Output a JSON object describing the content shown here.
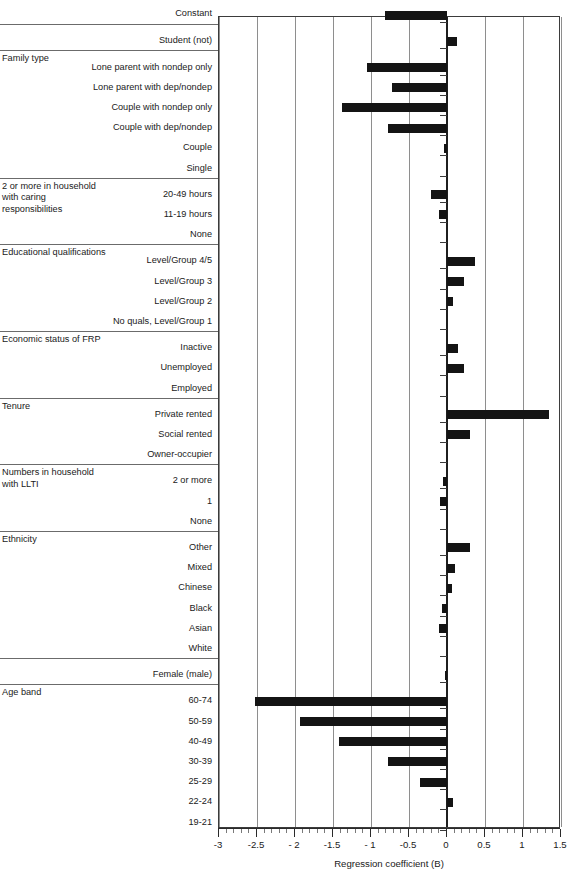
{
  "chart_data": {
    "type": "bar",
    "orientation": "horizontal",
    "title": "",
    "xlabel": "Regression coefficient (B)",
    "ylabel": "",
    "xlim": [
      -3,
      1.5
    ],
    "xticks": [
      -3,
      -2.5,
      -2,
      -1.5,
      -1,
      -0.5,
      0,
      0.5,
      1,
      1.5
    ],
    "xticklabels": [
      "-3",
      "-2.5",
      "- 2",
      "-1.5",
      "- 1",
      "-0.5",
      "0",
      "0.5",
      "1",
      "1.5"
    ],
    "grid": "vertical",
    "legend": "none",
    "minor_tick_step": 0.1,
    "groups": [
      {
        "title": "",
        "categories": [
          "Constant"
        ],
        "values": [
          -0.82
        ]
      },
      {
        "title": "",
        "categories": [
          "Student (not)"
        ],
        "values": [
          0.13
        ]
      },
      {
        "title": "Family type",
        "categories": [
          "Lone parent with nondep only",
          "Lone parent with dep/nondep",
          "Couple with nondep only",
          "Couple with dep/nondep",
          "Couple",
          "Single"
        ],
        "values": [
          -1.05,
          -0.73,
          -1.38,
          -0.78,
          -0.04,
          0
        ]
      },
      {
        "title": "2 or more in household with caring responsibilities",
        "categories": [
          "20-49 hours",
          "11-19 hours",
          "None"
        ],
        "values": [
          -0.21,
          -0.1,
          0
        ]
      },
      {
        "title": "Educational qualifications",
        "categories": [
          "Level/Group 4/5",
          "Level/Group 3",
          "Level/Group 2",
          "No quals, Level/Group 1"
        ],
        "values": [
          0.37,
          0.22,
          0.08,
          0
        ]
      },
      {
        "title": "Economic status of FRP",
        "categories": [
          "Inactive",
          "Unemployed",
          "Employed"
        ],
        "values": [
          0.14,
          0.22,
          0
        ]
      },
      {
        "title": "Tenure",
        "categories": [
          "Private rented",
          "Social rented",
          "Owner-occupier"
        ],
        "values": [
          1.34,
          0.3,
          0
        ]
      },
      {
        "title": "Numbers in household with LLTI",
        "categories": [
          "2 or more",
          "1",
          "None"
        ],
        "values": [
          -0.05,
          -0.09,
          0
        ]
      },
      {
        "title": "Ethnicity",
        "categories": [
          "Other",
          "Mixed",
          "Chinese",
          "Black",
          "Asian",
          "White"
        ],
        "values": [
          0.3,
          0.1,
          0.06,
          -0.07,
          -0.1,
          0
        ]
      },
      {
        "title": "",
        "categories": [
          "Female (male)"
        ],
        "values": [
          -0.03
        ]
      },
      {
        "title": "Age band",
        "categories": [
          "60-74",
          "50-59",
          "40-49",
          "30-39",
          "25-29",
          "22-24",
          "19-21"
        ],
        "values": [
          -2.52,
          -1.94,
          -1.42,
          -0.78,
          -0.36,
          0.08,
          0
        ]
      }
    ]
  },
  "axis": {
    "title": "Regression coefficient (B)"
  }
}
